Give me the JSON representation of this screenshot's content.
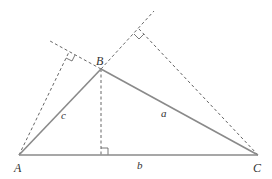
{
  "figure": {
    "vertices": {
      "A": {
        "label": "A",
        "x": 19,
        "y": 155
      },
      "B": {
        "label": "B",
        "x": 101,
        "y": 69
      },
      "C": {
        "label": "C",
        "x": 258,
        "y": 155
      }
    },
    "sides": {
      "a": {
        "label": "a",
        "between": "B-C"
      },
      "b": {
        "label": "b",
        "between": "A-C"
      },
      "c": {
        "label": "c",
        "between": "A-B"
      }
    },
    "altitudes": [
      {
        "from": "B",
        "to": "AC",
        "foot": {
          "x": 101,
          "y": 155
        }
      },
      {
        "from": "C",
        "to": "AB extended",
        "foot": {
          "x": 139,
          "y": 29
        }
      },
      {
        "from": "A",
        "to": "BC extended",
        "foot": {
          "x": 69,
          "y": 52
        }
      }
    ],
    "colors": {
      "side": "#8a8a8a",
      "dashed": "#555555",
      "label": "#333333"
    }
  }
}
